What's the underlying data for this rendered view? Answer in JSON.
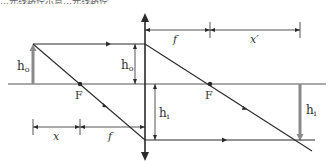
{
  "header": {
    "partial_text": "…光线路径示意…光线路径"
  },
  "diagram": {
    "labels": {
      "object_height_left": "h",
      "object_height_left_sub": "o",
      "object_height_lens": "h",
      "object_height_lens_sub": "o",
      "image_height_lens": "h",
      "image_height_lens_sub": "i",
      "image_height_right": "h",
      "image_height_right_sub": "i",
      "focal_left": "F",
      "focal_right": "F",
      "dim_x": "x",
      "dim_f_bottom": "f",
      "dim_f_top": "f",
      "dim_x_prime": "x′"
    },
    "colors": {
      "line": "#2a2a2a",
      "axis": "#555555",
      "arrow_fill": "#8a8a8a"
    }
  }
}
